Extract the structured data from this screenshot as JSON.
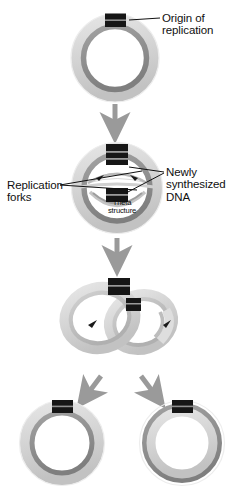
{
  "diagram": {
    "background_color": "#ffffff"
  },
  "labels": {
    "origin": "Origin of\nreplication",
    "replication_forks": "Replication\nforks",
    "newly_synthesized": "Newly\nsynthesized\nDNA",
    "theta_structure": "Theta\nstructure"
  },
  "colors": {
    "parental_strand_light": "#d9d9d9",
    "parental_strand_mid": "#b4b4b4",
    "daughter_strand_dark": "#8c8c8c",
    "origin_marker": "#161616",
    "origin_marker_line": "#8f8f8f",
    "leader_line": "#111111",
    "arrow_gray": "#9a9a9a",
    "text": "#101010",
    "outline": "#bdbdbd"
  },
  "stages": [
    {
      "id": "stage-1-parental-circle",
      "name": "Parental circular chromosome",
      "order": 1,
      "center": [
        115,
        58
      ],
      "radius": 40,
      "origin_marker": "top"
    },
    {
      "id": "stage-2-theta-structure",
      "name": "Theta structure with replication bubble",
      "order": 2,
      "center": [
        117,
        188
      ],
      "radius": 42,
      "origin_markers": [
        "top",
        "inner-center"
      ],
      "fork_arrowheads": 2
    },
    {
      "id": "stage-3-catenated-circles",
      "name": "Nearly completed interlocked daughter circles",
      "order": 3,
      "center": [
        118,
        318
      ],
      "origin_markers": 2,
      "fork_arrowheads": 2
    },
    {
      "id": "stage-4-daughter-left",
      "name": "Daughter chromosome (left)",
      "order": 4,
      "center": [
        62,
        443
      ],
      "radius": 39,
      "origin_marker": "top"
    },
    {
      "id": "stage-4-daughter-right",
      "name": "Daughter chromosome (right)",
      "order": 4,
      "center": [
        182,
        443
      ],
      "radius": 39,
      "origin_marker": "top"
    }
  ],
  "arrows": [
    {
      "id": "arrow-stage1-to-stage2",
      "direction": "down",
      "from": [
        115,
        103
      ],
      "to": [
        115,
        133
      ]
    },
    {
      "id": "arrow-stage2-to-stage3",
      "direction": "down",
      "from": [
        117,
        236
      ],
      "to": [
        117,
        264
      ]
    },
    {
      "id": "arrow-stage3-to-daughter-left",
      "direction": "down-left",
      "from": [
        99,
        374
      ],
      "to": [
        82,
        398
      ]
    },
    {
      "id": "arrow-stage3-to-daughter-right",
      "direction": "down-right",
      "from": [
        143,
        374
      ],
      "to": [
        160,
        398
      ]
    }
  ],
  "leader_lines": [
    {
      "id": "leader-origin",
      "label": "origin",
      "from": [
        131,
        22
      ],
      "to": [
        160,
        18
      ]
    },
    {
      "id": "leader-forks",
      "label": "replication_forks",
      "from": [
        62,
        184
      ],
      "to": [
        140,
        172
      ]
    },
    {
      "id": "leader-newdna-upper",
      "label": "newly_synthesized",
      "from": [
        164,
        172
      ],
      "to": [
        131,
        168
      ]
    },
    {
      "id": "leader-newdna-lower",
      "label": "newly_synthesized",
      "from": [
        164,
        174
      ],
      "to": [
        128,
        192
      ]
    }
  ]
}
